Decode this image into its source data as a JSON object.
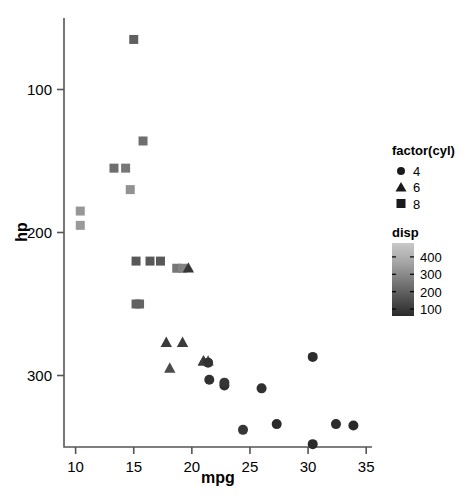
{
  "chart_data": {
    "type": "scatter",
    "title": "",
    "xlabel": "mpg",
    "ylabel": "hp",
    "xlim": [
      9.0,
      35.5
    ],
    "ylim": [
      50,
      350
    ],
    "xticks": [
      10,
      15,
      20,
      25,
      30,
      35
    ],
    "yticks": [
      100,
      200,
      300
    ],
    "grid": false,
    "legend_position": "right",
    "legends": [
      {
        "name": "factor(cyl)",
        "type": "discrete-shape",
        "entries": [
          {
            "label": "4",
            "shape": "circle"
          },
          {
            "label": "6",
            "shape": "triangle"
          },
          {
            "label": "8",
            "shape": "square"
          }
        ]
      },
      {
        "name": "disp",
        "type": "colorbar",
        "ticks": [
          400,
          300,
          200,
          100
        ],
        "min_color": "#2a2a2a",
        "max_color": "#c8c8c8",
        "range": [
          60,
          480
        ]
      }
    ],
    "encoding": {
      "x": "mpg",
      "y": "hp",
      "shape": "factor(cyl)",
      "color": "disp"
    },
    "points": [
      {
        "mpg": 21.0,
        "hp": 110,
        "cyl": 6,
        "disp": 160.0,
        "color": "#3a3a3a"
      },
      {
        "mpg": 21.0,
        "hp": 110,
        "cyl": 6,
        "disp": 160.0,
        "color": "#3a3a3a"
      },
      {
        "mpg": 22.8,
        "hp": 93,
        "cyl": 4,
        "disp": 108.0,
        "color": "#2e2e2e"
      },
      {
        "mpg": 21.4,
        "hp": 110,
        "cyl": 6,
        "disp": 258.0,
        "color": "#535353"
      },
      {
        "mpg": 18.7,
        "hp": 175,
        "cyl": 8,
        "disp": 360.0,
        "color": "#777777"
      },
      {
        "mpg": 18.1,
        "hp": 105,
        "cyl": 6,
        "disp": 225.0,
        "color": "#4b4b4b"
      },
      {
        "mpg": 14.3,
        "hp": 245,
        "cyl": 8,
        "disp": 360.0,
        "color": "#777777"
      },
      {
        "mpg": 24.4,
        "hp": 62,
        "cyl": 4,
        "disp": 146.7,
        "color": "#363636"
      },
      {
        "mpg": 22.8,
        "hp": 95,
        "cyl": 4,
        "disp": 140.8,
        "color": "#353535"
      },
      {
        "mpg": 19.2,
        "hp": 123,
        "cyl": 6,
        "disp": 167.6,
        "color": "#3b3b3b"
      },
      {
        "mpg": 17.8,
        "hp": 123,
        "cyl": 6,
        "disp": 167.6,
        "color": "#3b3b3b"
      },
      {
        "mpg": 16.4,
        "hp": 180,
        "cyl": 8,
        "disp": 275.8,
        "color": "#585858"
      },
      {
        "mpg": 17.3,
        "hp": 180,
        "cyl": 8,
        "disp": 275.8,
        "color": "#585858"
      },
      {
        "mpg": 15.2,
        "hp": 180,
        "cyl": 8,
        "disp": 275.8,
        "color": "#585858"
      },
      {
        "mpg": 10.4,
        "hp": 205,
        "cyl": 8,
        "disp": 472.0,
        "color": "#9a9a9a"
      },
      {
        "mpg": 10.4,
        "hp": 215,
        "cyl": 8,
        "disp": 460.0,
        "color": "#979797"
      },
      {
        "mpg": 14.7,
        "hp": 230,
        "cyl": 8,
        "disp": 440.0,
        "color": "#929292"
      },
      {
        "mpg": 32.4,
        "hp": 66,
        "cyl": 4,
        "disp": 78.7,
        "color": "#2b2b2b"
      },
      {
        "mpg": 30.4,
        "hp": 52,
        "cyl": 4,
        "disp": 75.7,
        "color": "#2a2a2a"
      },
      {
        "mpg": 33.9,
        "hp": 65,
        "cyl": 4,
        "disp": 71.1,
        "color": "#2a2a2a"
      },
      {
        "mpg": 21.5,
        "hp": 97,
        "cyl": 4,
        "disp": 120.1,
        "color": "#303030"
      },
      {
        "mpg": 15.5,
        "hp": 150,
        "cyl": 8,
        "disp": 318.0,
        "color": "#656565"
      },
      {
        "mpg": 15.2,
        "hp": 150,
        "cyl": 8,
        "disp": 304.0,
        "color": "#616161"
      },
      {
        "mpg": 13.3,
        "hp": 245,
        "cyl": 8,
        "disp": 350.0,
        "color": "#6e6e6e"
      },
      {
        "mpg": 19.2,
        "hp": 175,
        "cyl": 8,
        "disp": 400.0,
        "color": "#838383"
      },
      {
        "mpg": 27.3,
        "hp": 66,
        "cyl": 4,
        "disp": 79.0,
        "color": "#2b2b2b"
      },
      {
        "mpg": 26.0,
        "hp": 91,
        "cyl": 4,
        "disp": 120.3,
        "color": "#303030"
      },
      {
        "mpg": 30.4,
        "hp": 113,
        "cyl": 4,
        "disp": 95.1,
        "color": "#2d2d2d"
      },
      {
        "mpg": 15.8,
        "hp": 264,
        "cyl": 8,
        "disp": 351.0,
        "color": "#6e6e6e"
      },
      {
        "mpg": 19.7,
        "hp": 175,
        "cyl": 6,
        "disp": 145.0,
        "color": "#363636"
      },
      {
        "mpg": 15.0,
        "hp": 335,
        "cyl": 8,
        "disp": 301.0,
        "color": "#606060"
      },
      {
        "mpg": 21.4,
        "hp": 109,
        "cyl": 4,
        "disp": 121.0,
        "color": "#313131"
      }
    ]
  },
  "axes": {
    "x_title": "mpg",
    "y_title": "hp",
    "x_tick_labels": [
      "10",
      "15",
      "20",
      "25",
      "30",
      "35"
    ],
    "y_tick_labels": [
      "300",
      "200",
      "100"
    ]
  },
  "legend_shape": {
    "title": "factor(cyl)",
    "items": [
      {
        "label": "4",
        "shape": "circle"
      },
      {
        "label": "6",
        "shape": "triangle"
      },
      {
        "label": "8",
        "shape": "square"
      }
    ]
  },
  "legend_color": {
    "title": "disp",
    "tick_labels": [
      "400",
      "300",
      "200",
      "100"
    ]
  }
}
